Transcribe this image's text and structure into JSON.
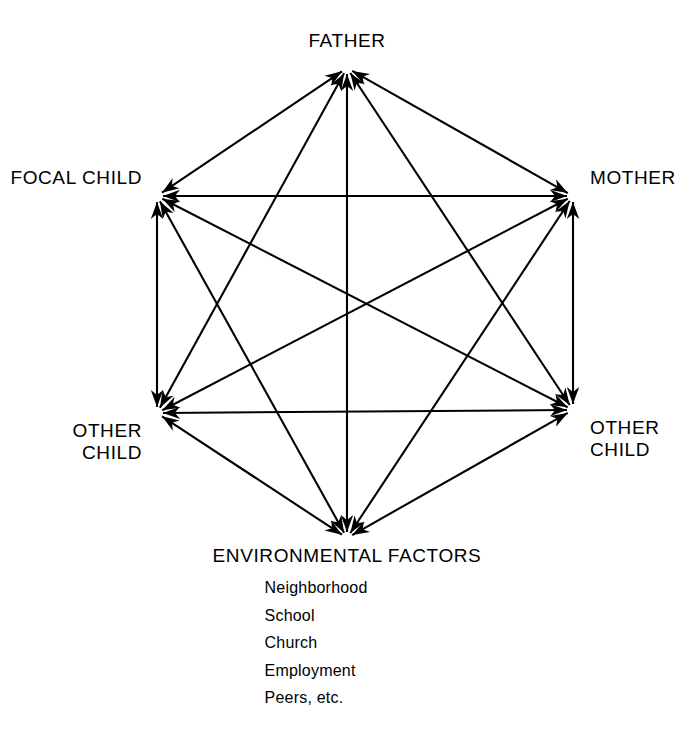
{
  "diagram": {
    "shape": "hexagon",
    "line_color": "#000000",
    "background_color": "#ffffff",
    "nodes": [
      {
        "id": "father",
        "label": "FATHER",
        "position": "top",
        "x": 347,
        "y": 68
      },
      {
        "id": "focal-child",
        "label": "FOCAL CHILD",
        "position": "upper-left",
        "x": 157,
        "y": 196
      },
      {
        "id": "mother",
        "label": "MOTHER",
        "position": "upper-right",
        "x": 573,
        "y": 196
      },
      {
        "id": "other-child-left",
        "label_line_1": "OTHER",
        "label_line_2": "CHILD",
        "position": "lower-left",
        "x": 157,
        "y": 413
      },
      {
        "id": "other-child-right",
        "label_line_1": "OTHER",
        "label_line_2": "CHILD",
        "position": "lower-right",
        "x": 573,
        "y": 410
      },
      {
        "id": "environmental-factors",
        "label": "ENVIRONMENTAL FACTORS",
        "position": "bottom",
        "x": 347,
        "y": 538
      }
    ],
    "environmental_factors_items": [
      "Neighborhood",
      "School",
      "Church",
      "Employment",
      "Peers, etc."
    ],
    "edges": [
      {
        "from": "father",
        "to": "focal-child",
        "bidirectional": true
      },
      {
        "from": "father",
        "to": "mother",
        "bidirectional": true
      },
      {
        "from": "father",
        "to": "other-child-left",
        "bidirectional": true
      },
      {
        "from": "father",
        "to": "other-child-right",
        "bidirectional": true
      },
      {
        "from": "father",
        "to": "environmental-factors",
        "bidirectional": true
      },
      {
        "from": "focal-child",
        "to": "mother",
        "bidirectional": true
      },
      {
        "from": "focal-child",
        "to": "other-child-left",
        "bidirectional": true
      },
      {
        "from": "focal-child",
        "to": "other-child-right",
        "bidirectional": true
      },
      {
        "from": "focal-child",
        "to": "environmental-factors",
        "bidirectional": true
      },
      {
        "from": "mother",
        "to": "other-child-left",
        "bidirectional": true
      },
      {
        "from": "mother",
        "to": "other-child-right",
        "bidirectional": true
      },
      {
        "from": "mother",
        "to": "environmental-factors",
        "bidirectional": true
      },
      {
        "from": "other-child-left",
        "to": "other-child-right",
        "bidirectional": true
      },
      {
        "from": "other-child-left",
        "to": "environmental-factors",
        "bidirectional": true
      },
      {
        "from": "other-child-right",
        "to": "environmental-factors",
        "bidirectional": true
      }
    ]
  }
}
